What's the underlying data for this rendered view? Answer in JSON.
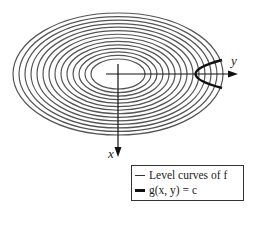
{
  "figure": {
    "type": "level-curves-with-constraint",
    "center": {
      "x": 118,
      "y": 74
    },
    "ellipses": {
      "count": 14,
      "outer_rx": 105,
      "outer_ry": 61,
      "inner_rx": 27,
      "inner_ry": 15,
      "stroke_color": "#555555"
    },
    "constraint_curve": {
      "shape": "parabola-opening-right",
      "vertex_x": 176,
      "end_x": 222,
      "half_width": 14,
      "stroke_color": "#111111"
    },
    "axes": {
      "horizontal_label": "y",
      "vertical_label": "x"
    }
  },
  "legend": {
    "items": [
      {
        "label": "Level curves of f",
        "style": "thin"
      },
      {
        "label": "g(x, y) = c",
        "style": "thick"
      }
    ]
  }
}
